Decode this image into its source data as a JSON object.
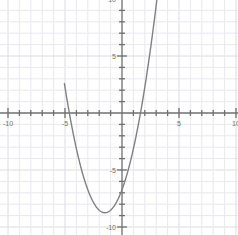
{
  "chart_data": {
    "type": "line",
    "title": "",
    "subtitle": "",
    "xlabel": "",
    "ylabel": "",
    "xlim": [
      -10.7,
      10.2
    ],
    "ylim": [
      -10.7,
      10.2
    ],
    "grid": true,
    "grid_step": 1,
    "minor_grid_step": 1,
    "legend": "none",
    "axis_color": "#6f6f6f",
    "grid_color": "#e8e8ee",
    "grid_major_color": "#dcdce4",
    "curve_color": "#808080",
    "background_color": "#ffffff",
    "xticks": [
      -10,
      -9,
      -8,
      -7,
      -6,
      -5,
      -4,
      -3,
      -2,
      -1,
      1,
      2,
      3,
      4,
      5,
      6,
      7,
      8,
      9,
      10
    ],
    "yticks": [
      -10,
      -9,
      -8,
      -7,
      -6,
      -5,
      -4,
      -3,
      -2,
      -1,
      1,
      2,
      3,
      4,
      5,
      6,
      7,
      8,
      9,
      10
    ],
    "xtick_labels": [
      {
        "value": -10,
        "text": "-10"
      },
      {
        "value": -5,
        "text": "-5"
      },
      {
        "value": 5,
        "text": "5"
      },
      {
        "value": 10,
        "text": "10"
      }
    ],
    "ytick_labels": [
      {
        "value": 10,
        "text": "10"
      },
      {
        "value": 5,
        "text": "5"
      },
      {
        "value": -5,
        "text": "-5"
      },
      {
        "value": -10,
        "text": "-10"
      }
    ],
    "series": [
      {
        "name": "parabola",
        "equation": "y = 0.9x^2 + 2.7x - 6.7",
        "color": "#808080",
        "linewidth": 1.4,
        "vertex": [
          -1.5,
          -8.75
        ],
        "y_intercept": -6.7,
        "x_intercepts": [
          -4.62,
          1.62
        ],
        "x": [
          -5.05,
          -4.8,
          -4.5,
          -4.2,
          -3.9,
          -3.6,
          -3.3,
          -3.0,
          -2.7,
          -2.4,
          -2.1,
          -1.8,
          -1.5,
          -1.2,
          -0.9,
          -0.6,
          -0.3,
          0.0,
          0.3,
          0.6,
          0.9,
          1.2,
          1.5,
          1.8,
          2.1,
          2.4,
          2.7,
          3.0,
          3.15
        ],
        "y": [
          10.1,
          7.12,
          4.53,
          2.12,
          -0.12,
          -2.17,
          -2.99,
          -6.7,
          -6.7,
          -8.0,
          -8.4,
          -8.65,
          -8.75,
          -8.65,
          -8.4,
          -8.0,
          -7.43,
          -6.7,
          -5.81,
          -4.76,
          -3.54,
          -2.17,
          -0.62,
          1.09,
          2.96,
          5.0,
          7.2,
          9.56,
          10.35
        ]
      }
    ],
    "x_axis_y": 0,
    "y_axis_x": 0
  },
  "axes": {
    "origin_px": [
      122,
      113
    ],
    "unit_px": 11.4
  }
}
